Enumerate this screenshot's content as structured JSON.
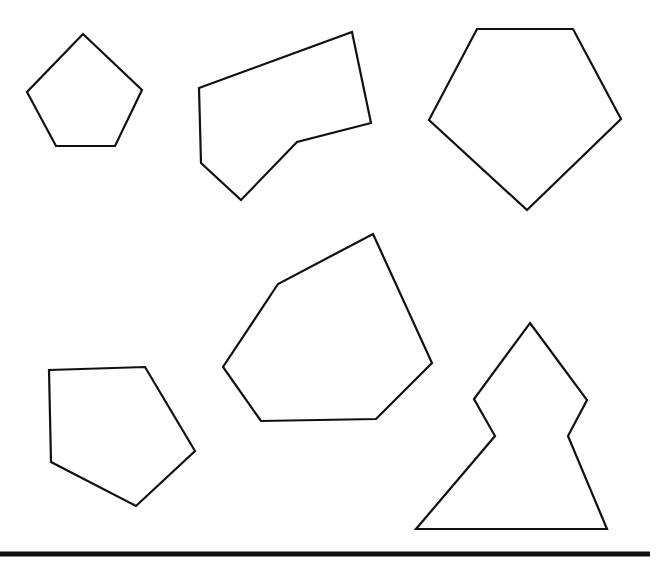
{
  "figure": {
    "width": 665,
    "height": 576,
    "background": "#ffffff",
    "stroke_color": "#111111",
    "shapes": [
      {
        "name": "small-regular-pentagon",
        "points": "83,34 142,90 115,146 56,146 27,92"
      },
      {
        "name": "concave-hexagon",
        "points": "352,32 371,123 297,142 241,200 201,163 199,88"
      },
      {
        "name": "large-regular-pentagon",
        "points": "477,29 573,29 621,119 527,210 429,120"
      },
      {
        "name": "irregular-hexagon",
        "points": "373,234 432,363 376,419 261,421 223,367 278,284"
      },
      {
        "name": "irregular-pentagon",
        "points": "49,370 145,367 195,451 136,506 51,462"
      },
      {
        "name": "tree-shaped-heptagon",
        "points": "530,323 587,400 568,436 607,529 416,529 495,436 474,399"
      }
    ],
    "baseline": {
      "x1": 0,
      "y1": 554,
      "x2": 650,
      "y2": 554
    }
  }
}
